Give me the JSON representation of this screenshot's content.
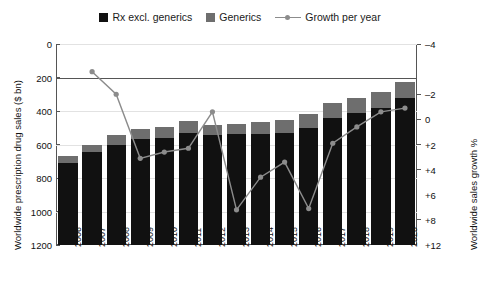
{
  "legend": {
    "items": [
      {
        "label": "Rx excl. generics",
        "marker": "square",
        "color": "#111111"
      },
      {
        "label": "Generics",
        "marker": "square",
        "color": "#6e6e6e"
      },
      {
        "label": "Growth per year",
        "marker": "line-dot",
        "color": "#8c8c8c"
      }
    ]
  },
  "axes": {
    "left_title": "Worldwide prescription drug sales ($ bn)",
    "right_title": "Worldwide sales growth %",
    "left_ticks": [
      "1200",
      "1000",
      "800",
      "600",
      "400",
      "200",
      "0"
    ],
    "right_ticks": [
      "+12",
      "+8",
      "+6",
      "+4",
      "+2",
      "0",
      "–2",
      "–4"
    ]
  },
  "chart_data": {
    "type": "bar",
    "title": "",
    "subtitle": "",
    "xlabel": "",
    "ylabel": "Worldwide prescription drug sales ($ bn)",
    "y2label": "Worldwide sales growth %",
    "ylim": [
      0,
      1200
    ],
    "y2lim": [
      -4,
      12
    ],
    "yticks": [
      0,
      200,
      400,
      600,
      800,
      1000,
      1200
    ],
    "y2ticks": [
      -4,
      -2,
      0,
      2,
      4,
      6,
      8,
      12
    ],
    "grid": true,
    "legend_position": "top-center",
    "categories": [
      "2006",
      "2007",
      "2008",
      "2009",
      "2010",
      "2011",
      "2012",
      "2013",
      "2014",
      "2015",
      "2016",
      "2017",
      "2018",
      "2019",
      "2020"
    ],
    "series": [
      {
        "name": "Rx excl. generics",
        "type": "bar",
        "stack": "sales",
        "color": "#111111",
        "values": [
          490,
          555,
          600,
          630,
          640,
          670,
          655,
          660,
          665,
          670,
          700,
          760,
          790,
          820,
          875
        ]
      },
      {
        "name": "Generics",
        "type": "bar",
        "stack": "sales",
        "color": "#6e6e6e",
        "values": [
          40,
          45,
          55,
          60,
          65,
          70,
          60,
          65,
          70,
          75,
          80,
          85,
          90,
          95,
          100
        ]
      },
      {
        "name": "Growth per year",
        "type": "line",
        "axis": "y2",
        "color": "#8c8c8c",
        "values": [
          null,
          9.8,
          8.0,
          2.9,
          3.4,
          3.7,
          6.6,
          -1.2,
          1.4,
          2.6,
          -1.1,
          4.1,
          5.4,
          6.6,
          6.9
        ]
      }
    ],
    "totals": [
      530,
      600,
      655,
      690,
      705,
      740,
      715,
      725,
      735,
      745,
      780,
      845,
      880,
      915,
      975
    ]
  }
}
